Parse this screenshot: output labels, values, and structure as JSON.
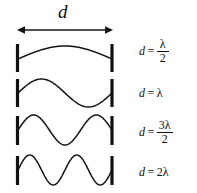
{
  "figure": {
    "title_label": "d",
    "dimension_label": "d",
    "background_color": "#ffffff",
    "stroke_color": "#141414",
    "wall_color": "#101010"
  },
  "dimension": {
    "label": "d",
    "arrow_left_name": "left-arrowhead",
    "arrow_right_name": "right-arrowhead",
    "x_start": 18,
    "x_end": 112
  },
  "harmonics": [
    {
      "index": 1,
      "name": "fundamental",
      "half_wavelengths": 1,
      "equation": {
        "variable": "d",
        "relation": "=",
        "numerator": "λ",
        "denominator": "2",
        "is_fraction": true,
        "text": "d = λ/2"
      }
    },
    {
      "index": 2,
      "name": "second-harmonic",
      "half_wavelengths": 2,
      "equation": {
        "variable": "d",
        "relation": "=",
        "value": "λ",
        "is_fraction": false,
        "text": "d = λ"
      }
    },
    {
      "index": 3,
      "name": "third-harmonic",
      "half_wavelengths": 3,
      "equation": {
        "variable": "d",
        "relation": "=",
        "numerator": "3λ",
        "denominator": "2",
        "is_fraction": true,
        "text": "d = 3λ/2"
      }
    },
    {
      "index": 4,
      "name": "fourth-harmonic",
      "half_wavelengths": 4,
      "equation": {
        "variable": "d",
        "relation": "=",
        "value": "2λ",
        "is_fraction": false,
        "text": "d = 2λ"
      }
    }
  ],
  "chart_data": {
    "type": "line",
    "xlabel": "",
    "ylabel": "",
    "xlim": [
      18,
      112
    ],
    "grid": false,
    "legend": "none",
    "series": [
      {
        "name": "d = λ/2",
        "half_wavelengths": 1,
        "amplitude": 13,
        "baseline_y": 59,
        "x_start": 18,
        "x_end": 112
      },
      {
        "name": "d = λ",
        "half_wavelengths": 2,
        "amplitude": 14,
        "baseline_y": 93,
        "x_start": 18,
        "x_end": 112
      },
      {
        "name": "d = 3λ/2",
        "half_wavelengths": 3,
        "amplitude": 15,
        "baseline_y": 130,
        "x_start": 18,
        "x_end": 112
      },
      {
        "name": "d = 2λ",
        "half_wavelengths": 4,
        "amplitude": 15,
        "baseline_y": 170,
        "x_start": 18,
        "x_end": 112
      }
    ],
    "annotations": [
      "d",
      "d = λ/2",
      "d = λ",
      "d = 3λ/2",
      "d = 2λ"
    ]
  }
}
